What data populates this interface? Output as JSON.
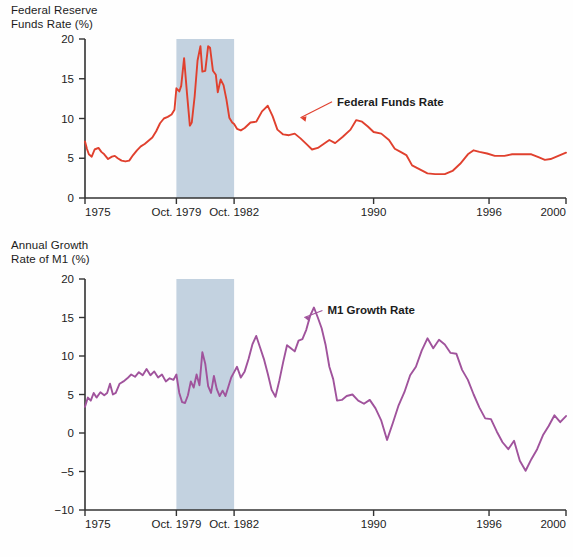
{
  "figure": {
    "background_color": "#fefefe",
    "recession_band_color": "#c3d2e0"
  },
  "panels": [
    {
      "id": "fed-funds-rate",
      "axis_title_line1": "Federal Reserve",
      "axis_title_line2": "Funds Rate (%)",
      "series_label": "Federal Funds Rate",
      "color": "#e0402e"
    },
    {
      "id": "m1-growth-rate",
      "axis_title_line1": "Annual Growth",
      "axis_title_line2": "Rate of M1 (%)",
      "series_label": "M1 Growth Rate",
      "color": "#a0539c"
    }
  ],
  "chart_data": [
    {
      "type": "line",
      "title": "Federal Reserve Funds Rate (%)",
      "xlabel": "",
      "ylabel": "Federal Reserve Funds Rate (%)",
      "xlim": [
        1975.0,
        2000.0
      ],
      "ylim": [
        0,
        20
      ],
      "yticks": [
        0,
        5,
        10,
        15,
        20
      ],
      "ytick_labels": [
        "0",
        "5",
        "10",
        "15",
        "20"
      ],
      "xticks": [
        1975.0,
        1979.75,
        1982.75,
        1990.0,
        1996.0,
        2000.0
      ],
      "xtick_labels": [
        "1975",
        "Oct. 1979",
        "Oct. 1982",
        "1990",
        "1996",
        "2000"
      ],
      "grid": false,
      "legend": "annotation",
      "annotations": [
        {
          "text": "Federal Funds Rate",
          "x": 1988.1,
          "y": 11.6,
          "arrow_to_x": 1986.2,
          "arrow_to_y": 10.1
        }
      ],
      "shaded_region": {
        "label": "Oct. 1979 - Oct. 1982",
        "x_start": 1979.75,
        "x_end": 1982.75,
        "color": "#c3d2e0"
      },
      "series": [
        {
          "name": "Federal Funds Rate",
          "color": "#e0402e",
          "x": [
            1975.0,
            1975.1,
            1975.2,
            1975.35,
            1975.5,
            1975.7,
            1975.85,
            1976.0,
            1976.2,
            1976.4,
            1976.55,
            1976.7,
            1976.9,
            1977.1,
            1977.3,
            1977.5,
            1977.7,
            1977.9,
            1978.1,
            1978.3,
            1978.5,
            1978.7,
            1978.9,
            1979.1,
            1979.3,
            1979.5,
            1979.65,
            1979.75,
            1979.9,
            1980.0,
            1980.15,
            1980.3,
            1980.45,
            1980.55,
            1980.7,
            1980.85,
            1981.0,
            1981.1,
            1981.25,
            1981.4,
            1981.5,
            1981.65,
            1981.8,
            1981.9,
            1982.05,
            1982.2,
            1982.35,
            1982.5,
            1982.65,
            1982.75,
            1982.9,
            1983.1,
            1983.3,
            1983.6,
            1983.9,
            1984.2,
            1984.5,
            1984.75,
            1985.0,
            1985.3,
            1985.6,
            1985.9,
            1986.2,
            1986.5,
            1986.8,
            1987.1,
            1987.4,
            1987.7,
            1988.0,
            1988.4,
            1988.8,
            1989.1,
            1989.4,
            1989.7,
            1990.0,
            1990.4,
            1990.8,
            1991.1,
            1991.4,
            1991.7,
            1992.0,
            1992.4,
            1992.8,
            1993.2,
            1993.7,
            1994.1,
            1994.5,
            1994.9,
            1995.2,
            1995.5,
            1995.9,
            1996.3,
            1996.8,
            1997.2,
            1997.7,
            1998.2,
            1998.6,
            1998.9,
            1999.2,
            1999.6,
            2000.0
          ],
          "y": [
            7.1,
            6.2,
            5.5,
            5.2,
            6.1,
            6.3,
            5.8,
            5.5,
            4.9,
            5.2,
            5.3,
            5.0,
            4.7,
            4.6,
            4.7,
            5.4,
            6.0,
            6.5,
            6.8,
            7.2,
            7.6,
            8.4,
            9.4,
            10.0,
            10.2,
            10.5,
            11.1,
            13.8,
            13.4,
            14.1,
            17.6,
            13.2,
            9.1,
            9.5,
            12.8,
            17.3,
            19.1,
            15.9,
            16.0,
            19.1,
            18.9,
            16.0,
            15.5,
            13.3,
            14.9,
            14.2,
            12.4,
            10.1,
            9.5,
            9.3,
            8.7,
            8.5,
            8.8,
            9.5,
            9.6,
            10.9,
            11.6,
            10.3,
            8.6,
            8.0,
            7.9,
            8.1,
            7.5,
            6.8,
            6.1,
            6.3,
            6.8,
            7.3,
            6.9,
            7.7,
            8.6,
            9.8,
            9.6,
            9.0,
            8.3,
            8.1,
            7.3,
            6.2,
            5.8,
            5.4,
            4.1,
            3.6,
            3.1,
            3.0,
            3.0,
            3.4,
            4.3,
            5.5,
            6.0,
            5.8,
            5.6,
            5.3,
            5.3,
            5.5,
            5.5,
            5.5,
            5.1,
            4.8,
            4.9,
            5.3,
            5.7
          ]
        }
      ]
    },
    {
      "type": "line",
      "title": "Annual Growth Rate of M1 (%)",
      "xlabel": "",
      "ylabel": "Annual Growth Rate of M1 (%)",
      "xlim": [
        1975.0,
        2000.0
      ],
      "ylim": [
        -10,
        20
      ],
      "yticks": [
        -10,
        -5,
        0,
        5,
        10,
        15,
        20
      ],
      "ytick_labels": [
        "−10",
        "−5",
        "0",
        "5",
        "10",
        "15",
        "20"
      ],
      "xticks": [
        1975.0,
        1979.75,
        1982.75,
        1990.0,
        1996.0,
        2000.0
      ],
      "xtick_labels": [
        "1975",
        "Oct. 1979",
        "Oct. 1982",
        "1990",
        "1996",
        "2000"
      ],
      "grid": false,
      "legend": "annotation",
      "annotations": [
        {
          "text": "M1 Growth Rate",
          "x": 1987.6,
          "y": 15.4,
          "arrow_to_x": 1986.4,
          "arrow_to_y": 15.0
        }
      ],
      "shaded_region": {
        "label": "Oct. 1979 - Oct. 1982",
        "x_start": 1979.75,
        "x_end": 1982.75,
        "color": "#c3d2e0"
      },
      "series": [
        {
          "name": "M1 Growth Rate",
          "color": "#a0539c",
          "x": [
            1975.0,
            1975.15,
            1975.3,
            1975.45,
            1975.6,
            1975.8,
            1976.0,
            1976.15,
            1976.3,
            1976.45,
            1976.6,
            1976.8,
            1977.0,
            1977.2,
            1977.4,
            1977.6,
            1977.8,
            1978.0,
            1978.2,
            1978.4,
            1978.6,
            1978.8,
            1979.0,
            1979.2,
            1979.4,
            1979.6,
            1979.75,
            1979.9,
            1980.05,
            1980.2,
            1980.35,
            1980.5,
            1980.65,
            1980.8,
            1980.95,
            1981.1,
            1981.25,
            1981.4,
            1981.55,
            1981.7,
            1981.85,
            1982.0,
            1982.15,
            1982.3,
            1982.45,
            1982.6,
            1982.75,
            1982.9,
            1983.1,
            1983.3,
            1983.5,
            1983.7,
            1983.9,
            1984.1,
            1984.3,
            1984.5,
            1984.7,
            1984.9,
            1985.1,
            1985.3,
            1985.5,
            1985.7,
            1985.9,
            1986.1,
            1986.3,
            1986.5,
            1986.7,
            1986.9,
            1987.1,
            1987.3,
            1987.5,
            1987.7,
            1987.9,
            1988.1,
            1988.35,
            1988.6,
            1988.9,
            1989.2,
            1989.5,
            1989.8,
            1990.1,
            1990.4,
            1990.7,
            1991.0,
            1991.3,
            1991.6,
            1991.9,
            1992.2,
            1992.5,
            1992.8,
            1993.1,
            1993.4,
            1993.7,
            1994.0,
            1994.3,
            1994.6,
            1994.9,
            1995.2,
            1995.5,
            1995.8,
            1996.1,
            1996.4,
            1996.7,
            1997.0,
            1997.3,
            1997.6,
            1997.9,
            1998.2,
            1998.5,
            1998.8,
            1999.1,
            1999.4,
            1999.7,
            2000.0
          ],
          "y": [
            3.4,
            4.6,
            4.2,
            5.2,
            4.6,
            5.3,
            4.9,
            5.2,
            6.4,
            5.0,
            5.2,
            6.4,
            6.7,
            7.1,
            7.6,
            7.3,
            7.9,
            7.5,
            8.3,
            7.5,
            8.0,
            7.2,
            7.6,
            6.7,
            7.1,
            6.9,
            7.6,
            5.2,
            4.0,
            3.9,
            4.9,
            6.7,
            5.9,
            7.6,
            6.2,
            10.5,
            9.0,
            6.1,
            5.2,
            7.4,
            5.7,
            4.8,
            5.5,
            4.8,
            6.0,
            7.2,
            7.9,
            8.6,
            7.2,
            8.0,
            9.6,
            11.5,
            12.6,
            11.1,
            9.6,
            7.7,
            5.6,
            4.7,
            6.8,
            9.2,
            11.4,
            11.0,
            10.6,
            12.0,
            12.2,
            13.4,
            15.2,
            16.3,
            15.0,
            13.6,
            11.5,
            8.6,
            7.0,
            4.2,
            4.3,
            4.8,
            5.0,
            4.2,
            3.8,
            4.3,
            3.2,
            1.6,
            -0.9,
            1.3,
            3.6,
            5.3,
            7.5,
            8.6,
            10.7,
            12.3,
            11.0,
            12.1,
            11.5,
            10.4,
            10.3,
            8.2,
            6.9,
            5.0,
            3.3,
            1.9,
            1.8,
            0.2,
            -1.2,
            -2.1,
            -1.0,
            -3.6,
            -4.9,
            -3.4,
            -2.1,
            -0.3,
            0.9,
            2.3,
            1.4,
            2.2,
            1.5,
            2.2
          ]
        }
      ]
    }
  ]
}
